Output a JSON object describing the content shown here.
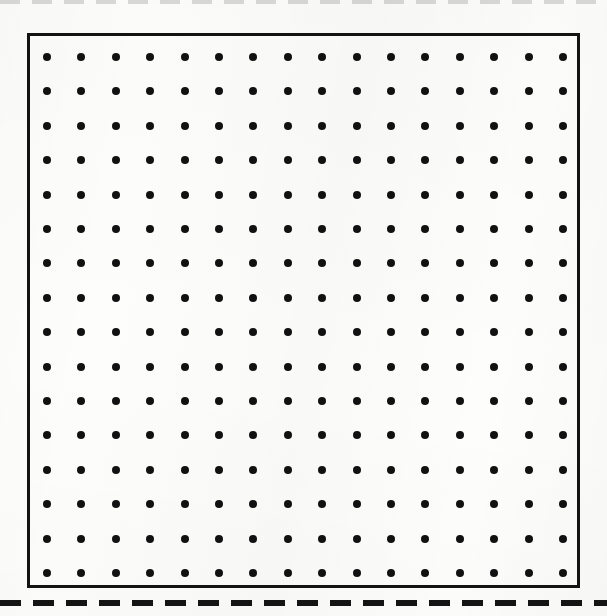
{
  "document": {
    "type": "dot-grid-worksheet",
    "page_width": 607,
    "page_height": 616,
    "background_color": "#fdfdfc",
    "ink_color": "#111111"
  },
  "grid_frame": {
    "name": "dot grid border",
    "left": 27,
    "top": 33,
    "width": 553,
    "height": 555,
    "border_width": 3,
    "border_color": "#131313"
  },
  "dot_grid": {
    "columns": 16,
    "rows": 16,
    "total_dots": 256,
    "dot_diameter": 8,
    "dot_color": "#111111",
    "spacing_x": 34.4,
    "spacing_y": 34.4,
    "first_dot_x": 44,
    "first_dot_y": 54
  },
  "cut_lines": [
    {
      "name": "bottom-cut-line",
      "position": "bottom",
      "top": 600,
      "thickness": 6,
      "dash_length": 21,
      "gap_length": 12,
      "color": "#141414",
      "visible": true
    },
    {
      "name": "top-cut-line",
      "position": "top",
      "top": 0,
      "thickness": 4,
      "dash_length": 20,
      "gap_length": 12,
      "color": "#282828",
      "visible": true
    }
  ]
}
